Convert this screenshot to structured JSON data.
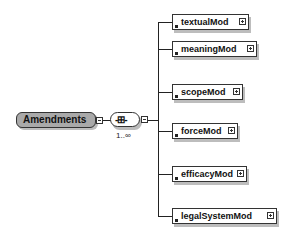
{
  "root": {
    "label": "Amendments"
  },
  "compositor": {
    "type": "sequence",
    "glyph": "-⊞-",
    "occurrence": "1..∞"
  },
  "children": [
    {
      "label": "textualMod",
      "top": 14,
      "width": 77
    },
    {
      "label": "meaningMod",
      "top": 41,
      "width": 85
    },
    {
      "label": "scopeMod",
      "top": 84,
      "width": 71
    },
    {
      "label": "forceMod",
      "top": 123,
      "width": 66
    },
    {
      "label": "efficacyMod",
      "top": 166,
      "width": 75
    },
    {
      "label": "legalSystemMod",
      "top": 208,
      "width": 105
    }
  ]
}
